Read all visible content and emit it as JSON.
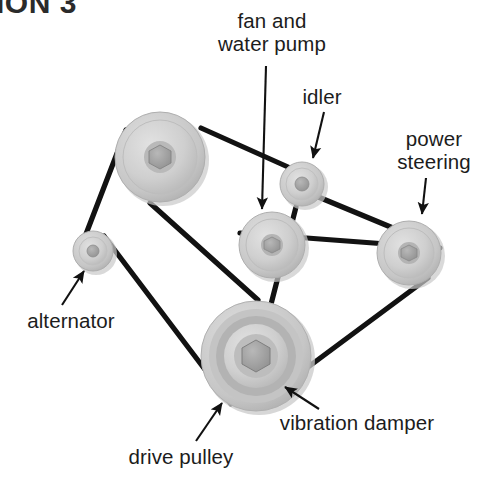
{
  "heading": {
    "text": "ION 3",
    "note_visible_partial": true,
    "color": "#2b2b2b"
  },
  "diagram": {
    "type": "serpentine-belt-drive-layout",
    "background": "#ffffff",
    "belt_color": "#121212",
    "pulley_fill_light": "#d8d8d8",
    "pulley_fill_mid": "#bfbfbf",
    "pulley_fill_dark": "#a6a6a6",
    "pulley_hub": "#9a9a9a",
    "shadow_color": "#c9c9c9"
  },
  "labels": [
    {
      "id": "fan-and-water-pump",
      "line1": "fan and",
      "line2": "water pump",
      "x": 272,
      "y": 10,
      "align": "center"
    },
    {
      "id": "idler",
      "line1": "idler",
      "line2": "",
      "x": 322,
      "y": 86,
      "align": "center"
    },
    {
      "id": "power-steering",
      "line1": "power",
      "line2": "steering",
      "x": 434,
      "y": 128,
      "align": "center"
    },
    {
      "id": "alternator",
      "line1": "alternator",
      "line2": "",
      "x": 71,
      "y": 310,
      "align": "center"
    },
    {
      "id": "drive-pulley",
      "line1": "drive pulley",
      "line2": "",
      "x": 181,
      "y": 446,
      "align": "center"
    },
    {
      "id": "vibration-damper",
      "line1": "vibration damper",
      "line2": "",
      "x": 357,
      "y": 412,
      "align": "center"
    }
  ],
  "pulleys": [
    {
      "id": "fan-water-pump-pulley",
      "cx": 160,
      "cy": 157,
      "r": 46
    },
    {
      "id": "idler-pulley",
      "cx": 302,
      "cy": 184,
      "r": 23
    },
    {
      "id": "alternator-pulley",
      "cx": 93,
      "cy": 251,
      "r": 21
    },
    {
      "id": "water-pump-pulley",
      "cx": 272,
      "cy": 245,
      "r": 34
    },
    {
      "id": "power-steering-pulley",
      "cx": 409,
      "cy": 253,
      "r": 33
    },
    {
      "id": "drive-pulley-damper",
      "cx": 256,
      "cy": 356,
      "r": 56
    }
  ],
  "arrows": [
    {
      "id": "arrow-fan-water-pump",
      "x1": 266,
      "y1": 66,
      "x2": 262,
      "y2": 212
    },
    {
      "id": "arrow-idler",
      "x1": 322,
      "y1": 112,
      "x2": 312,
      "y2": 160
    },
    {
      "id": "arrow-power-steering",
      "x1": 424,
      "y1": 176,
      "x2": 421,
      "y2": 216
    },
    {
      "id": "arrow-alternator",
      "x1": 63,
      "y1": 304,
      "x2": 83,
      "y2": 270
    },
    {
      "id": "arrow-drive-pulley",
      "x1": 196,
      "y1": 440,
      "x2": 221,
      "y2": 402
    },
    {
      "id": "arrow-vibration-damper",
      "x1": 318,
      "y1": 408,
      "x2": 284,
      "y2": 386
    }
  ]
}
